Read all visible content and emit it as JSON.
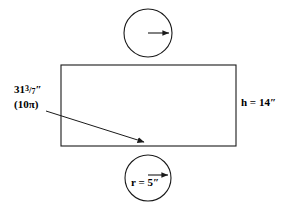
{
  "figure": {
    "stroke_color": "#1a1a1a",
    "fill_color": "none",
    "background": "#ffffff"
  },
  "labels": {
    "circumference": {
      "whole": "31",
      "numerator": "3",
      "bar": "/",
      "denominator": "7",
      "unit": "″",
      "alternate": "(10π)",
      "name": "circumference-label"
    },
    "height": {
      "text": "h = 14″",
      "name": "height-label"
    },
    "radius": {
      "text": "r = 5″",
      "name": "radius-label"
    }
  },
  "shapes": {
    "rectangle": {
      "x": 61,
      "y": 65,
      "width": 175,
      "height": 81,
      "meaning": "lateral-surface"
    },
    "top_circle": {
      "cx": 148,
      "cy": 33,
      "r": 24,
      "meaning": "top-base"
    },
    "bottom_circle": {
      "cx": 148,
      "cy": 178,
      "r": 23,
      "meaning": "bottom-base"
    },
    "top_radius_arrow": {
      "x1": 148,
      "y1": 33,
      "x2": 171,
      "y2": 33
    },
    "bottom_radius_arrow": {
      "x1": 148,
      "y1": 175,
      "x2": 170,
      "y2": 175
    },
    "circumference_leader_arrow": {
      "x1": 46,
      "y1": 111,
      "x2": 146,
      "y2": 143
    }
  }
}
